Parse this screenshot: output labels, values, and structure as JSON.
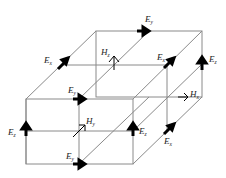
{
  "diagram": {
    "title": "",
    "type": "yee-cell",
    "colors": {
      "edge": "#8a8a8a",
      "arrow": "#000000",
      "text": "#222222",
      "background": "#ffffff"
    },
    "labels": [
      {
        "id": "ex-top-left",
        "main": "E",
        "sub": "x"
      },
      {
        "id": "ey-top-back",
        "main": "E",
        "sub": "y"
      },
      {
        "id": "hz-top",
        "main": "H",
        "sub": "z"
      },
      {
        "id": "ex-top-right",
        "main": "E",
        "sub": "x"
      },
      {
        "id": "ez-back-right",
        "main": "E",
        "sub": "z"
      },
      {
        "id": "ey-front-top",
        "main": "E",
        "sub": "y"
      },
      {
        "id": "hx-right",
        "main": "H",
        "sub": "x"
      },
      {
        "id": "ez-front-left",
        "main": "E",
        "sub": "z"
      },
      {
        "id": "hy-front",
        "main": "H",
        "sub": "y"
      },
      {
        "id": "ez-front-right",
        "main": "E",
        "sub": "z"
      },
      {
        "id": "ex-bottom-right",
        "main": "E",
        "sub": "x"
      },
      {
        "id": "ey-front-bottom",
        "main": "E",
        "sub": "y"
      }
    ]
  }
}
